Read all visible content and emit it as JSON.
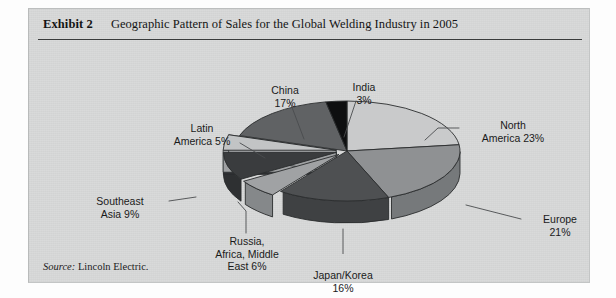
{
  "exhibit": {
    "label": "Exhibit 2",
    "title": "Geographic Pattern of Sales for the Global Welding Industry in 2005",
    "source_keyword": "Source:",
    "source_text": " Lincoln Electric."
  },
  "chart_data": {
    "type": "pie",
    "title": "Geographic Pattern of Sales for the Global Welding Industry in 2005",
    "unit": "percent",
    "total": 100,
    "legend_position": "callout-labels",
    "style": "3d-exploded-grayscale",
    "categories": [
      "North America",
      "Europe",
      "Japan/Korea",
      "Russia, Africa, Middle East",
      "Southeast Asia",
      "Latin America",
      "China",
      "India"
    ],
    "values": [
      23,
      21,
      16,
      6,
      9,
      5,
      17,
      3
    ],
    "slices": [
      {
        "name": "North America",
        "value": 23,
        "label": "North\nAmerica 23%",
        "percent_text": "23%",
        "top_color": "#c9cacb",
        "side_color": "#a9abac",
        "exploded": false
      },
      {
        "name": "Europe",
        "value": 21,
        "label": "Europe\n21%",
        "percent_text": "21%",
        "top_color": "#8f9193",
        "side_color": "#76797b",
        "exploded": false
      },
      {
        "name": "Japan/Korea",
        "value": 16,
        "label": "Japan/Korea\n16%",
        "percent_text": "16%",
        "top_color": "#4e5052",
        "side_color": "#3f4143",
        "exploded": false
      },
      {
        "name": "Russia, Africa, Middle East",
        "value": 6,
        "label": "Russia,\nAfrica, Middle\nEast 6%",
        "percent_text": "6%",
        "top_color": "#a0a2a4",
        "side_color": "#85888a",
        "exploded": true
      },
      {
        "name": "Southeast Asia",
        "value": 9,
        "label": "Southeast\nAsia 9%",
        "percent_text": "9%",
        "top_color": "#3a3c3e",
        "side_color": "#2e3032",
        "exploded": true
      },
      {
        "name": "Latin America",
        "value": 5,
        "label": "Latin\nAmerica 5%",
        "percent_text": "5%",
        "top_color": "#c2c4c5",
        "side_color": "#9fa1a3",
        "exploded": true
      },
      {
        "name": "China",
        "value": 17,
        "label": "China\n17%",
        "percent_text": "17%",
        "top_color": "#606264",
        "side_color": "#4c4e50",
        "exploded": false
      },
      {
        "name": "India",
        "value": 3,
        "label": "India\n3%",
        "percent_text": "3%",
        "top_color": "#0e0f10",
        "side_color": "#090a0b",
        "exploded": false
      }
    ]
  },
  "colors": {
    "panel_background": "#d9dada",
    "rule": "#3a3c3c",
    "text": "#1a1a1a",
    "leader_line": "#4a4c4e"
  }
}
